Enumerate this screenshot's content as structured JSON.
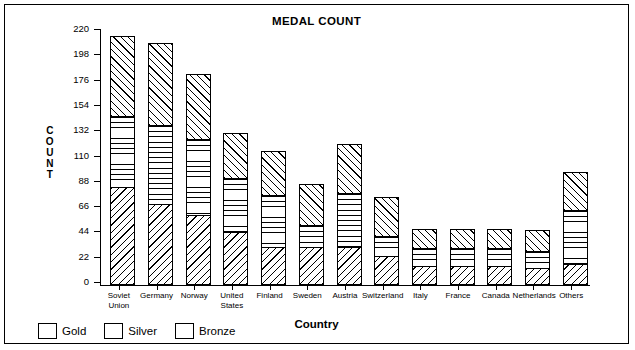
{
  "chart_data": {
    "type": "bar",
    "subtype": "stacked-vertical",
    "title": "MEDAL COUNT",
    "xlabel": "Country",
    "ylabel": "COUNT",
    "ylim": [
      0,
      220
    ],
    "yticks": [
      0,
      22,
      44,
      66,
      88,
      110,
      132,
      154,
      176,
      198,
      220
    ],
    "grid": false,
    "legend_position": "bottom-left",
    "categories": [
      "Soviet Union",
      "Germany",
      "Norway",
      "United States",
      "Finland",
      "Sweden",
      "Austria",
      "Switzerland",
      "Italy",
      "France",
      "Canada",
      "Netherlands",
      "Others"
    ],
    "series": [
      {
        "name": "Gold",
        "pattern": "diagonal-backslash-hatch",
        "values": [
          84,
          70,
          60,
          45,
          32,
          32,
          32,
          24,
          16,
          16,
          16,
          14,
          17
        ]
      },
      {
        "name": "Silver",
        "pattern": "horizontal-line-hatch",
        "values": [
          62,
          68,
          66,
          47,
          45,
          19,
          47,
          18,
          15,
          15,
          15,
          15,
          47
        ]
      },
      {
        "name": "Bronze",
        "pattern": "diagonal-forwardslash-hatch",
        "values": [
          70,
          72,
          57,
          39,
          39,
          36,
          43,
          34,
          17,
          17,
          17,
          18,
          33
        ]
      }
    ],
    "totals": [
      216,
      210,
      183,
      131,
      116,
      87,
      122,
      76,
      48,
      48,
      48,
      47,
      97
    ],
    "stack_order_bottom_to_top": [
      "Gold",
      "Silver",
      "Bronze"
    ],
    "colors": {
      "ink": "#000000",
      "background": "#ffffff"
    }
  },
  "legend": {
    "items": [
      {
        "label": "Gold",
        "swatch": "gold-hatch-swatch"
      },
      {
        "label": "Silver",
        "swatch": "silver-hatch-swatch"
      },
      {
        "label": "Bronze",
        "swatch": "bronze-hatch-swatch"
      }
    ]
  },
  "axis": {
    "y_title_letters": [
      "C",
      "O",
      "U",
      "N",
      "T"
    ],
    "y_title_text": "COUNT"
  }
}
